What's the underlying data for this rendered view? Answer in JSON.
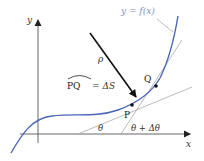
{
  "figure": {
    "type": "curvature diagram",
    "curve_label": "y = f(x)",
    "x_axis_label": "x",
    "y_axis_label": "y",
    "radius_label": "ρ",
    "arc_label_left": "PQ",
    "arc_label_right": "= ΔS",
    "point_p_label": "P",
    "point_q_label": "Q",
    "angle_theta_label": "θ",
    "angle_theta_delta_label": "θ + Δθ"
  },
  "colors": {
    "curve": "#4a66b8",
    "curve_label": "#7d95c9",
    "axis": "#666666",
    "tangent": "#aaaaaa",
    "radius_arrow": "#111111",
    "point": "#111111"
  }
}
